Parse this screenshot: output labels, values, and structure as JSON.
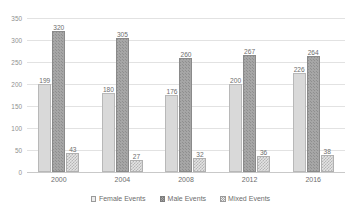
{
  "chart_data": {
    "type": "bar",
    "title": "",
    "subtitle": "",
    "xlabel": "",
    "ylabel": "",
    "categories": [
      "2000",
      "2004",
      "2008",
      "2012",
      "2016"
    ],
    "series": [
      {
        "name": "Female Events",
        "values": [
          199,
          180,
          176,
          200,
          226
        ]
      },
      {
        "name": "Male Events",
        "values": [
          320,
          305,
          260,
          267,
          264
        ]
      },
      {
        "name": "Mixed Events",
        "values": [
          43,
          27,
          32,
          36,
          38
        ]
      }
    ],
    "ylim": [
      0,
      350
    ],
    "yticks": [
      0,
      50,
      100,
      150,
      200,
      250,
      300,
      350
    ],
    "ytick_labels": [
      "0",
      "50",
      "100",
      "150",
      "200",
      "250",
      "300",
      "350"
    ],
    "grid": true,
    "grid_axis": "y",
    "legend": true,
    "legend_position": "bottom",
    "data_labels": true,
    "colors": {
      "female": "#d9d9d9",
      "male": "#a6a6a6",
      "mixed": "#e3e3e3",
      "gridline": "#e2e2e2",
      "axis": "#c9c9c9",
      "text": "#6d6d6d",
      "background": "#ffffff"
    }
  }
}
